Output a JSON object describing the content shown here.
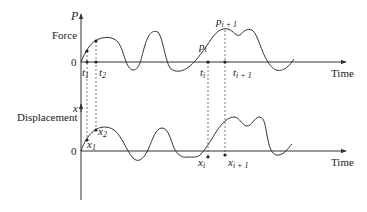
{
  "force_plot": {
    "axis_label": "P",
    "axis_title": "Force",
    "origin": "0",
    "time_label": "Time",
    "points": [
      {
        "sym": "t",
        "sub": "1"
      },
      {
        "sym": "t",
        "sub": "2"
      },
      {
        "sym": "t",
        "sub": "i"
      },
      {
        "sym": "t",
        "sub": "i + 1"
      }
    ],
    "markers": [
      {
        "sym": "p",
        "sub": "i"
      },
      {
        "sym": "p",
        "sub": "i + 1"
      }
    ]
  },
  "displacement_plot": {
    "axis_label": "x",
    "axis_title": "Displacement",
    "origin": "0",
    "time_label": "Time",
    "points": [
      {
        "sym": "x",
        "sub": "1"
      },
      {
        "sym": "x",
        "sub": "2"
      },
      {
        "sym": "x",
        "sub": "i"
      },
      {
        "sym": "x",
        "sub": "i + 1"
      }
    ]
  },
  "colors": {
    "line": "#333333",
    "text": "#222222"
  }
}
